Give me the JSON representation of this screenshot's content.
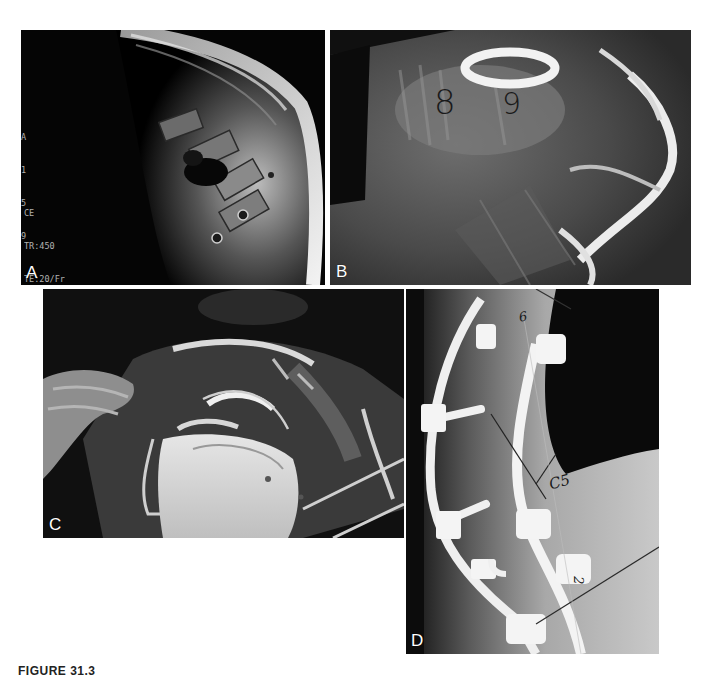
{
  "figure": {
    "caption_label": "FIGURE 31.3",
    "panels": [
      {
        "id": "A",
        "label": "A",
        "type": "MRI sagittal image",
        "side_markers": [
          "A",
          "1",
          "5",
          "9"
        ],
        "scan_params": {
          "line1": "CE",
          "line2": "TR:450",
          "line3": "TE:20/Fr",
          "line4": "EC:1/1 4.9kHz",
          "line5": "CTLMID",
          "line6": "FOV:48cm",
          "line7": "8thk/1.0sp",
          "line8": "07:44"
        }
      },
      {
        "id": "B",
        "label": "B",
        "type": "CT reconstruction",
        "annotations": [
          "8",
          "9"
        ]
      },
      {
        "id": "C",
        "label": "C",
        "type": "intraoperative photograph"
      },
      {
        "id": "D",
        "label": "D",
        "type": "lateral radiograph with instrumentation",
        "annotations": [
          "6",
          "C5",
          "2"
        ]
      }
    ]
  },
  "colors": {
    "background": "#ffffff",
    "panel_bg": "#000000",
    "label": "#ffffff"
  }
}
